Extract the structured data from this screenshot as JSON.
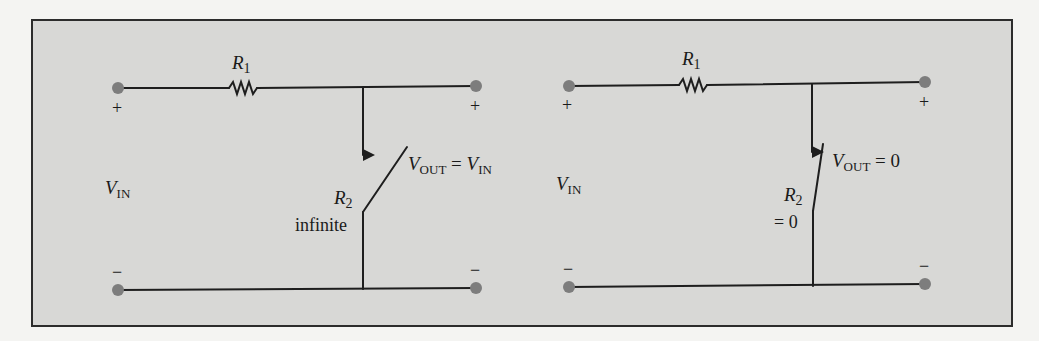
{
  "figure": {
    "background_color": "#d8d8d6",
    "border_color": "#2c2c2c",
    "page_color": "#f4f4f2",
    "wire_color": "#1e1e1e",
    "terminal_color": "#7d7d7d"
  },
  "circuits": [
    {
      "id": "switch-open",
      "resistor_top": {
        "name": "R",
        "subscript": "1"
      },
      "resistor_switch": {
        "name": "R",
        "subscript": "2",
        "value_label": "infinite"
      },
      "input_label": {
        "name": "V",
        "subscript": "IN"
      },
      "output_label": {
        "name": "V",
        "subscript": "OUT",
        "equals": " = ",
        "rhs_name": "V",
        "rhs_subscript": "IN"
      },
      "input_plus": "+",
      "input_minus": "−",
      "output_plus": "+",
      "output_minus": "−",
      "switch_state": "open"
    },
    {
      "id": "switch-closed",
      "resistor_top": {
        "name": "R",
        "subscript": "1"
      },
      "resistor_switch": {
        "name": "R",
        "subscript": "2",
        "value_label": "= 0"
      },
      "input_label": {
        "name": "V",
        "subscript": "IN"
      },
      "output_label": {
        "name": "V",
        "subscript": "OUT",
        "equals": " = ",
        "rhs_value": "0"
      },
      "input_plus": "+",
      "input_minus": "−",
      "output_plus": "+",
      "output_minus": "−",
      "switch_state": "closed"
    }
  ]
}
